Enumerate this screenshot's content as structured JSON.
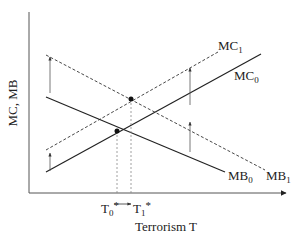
{
  "diagram": {
    "y_axis_label": "MC, MB",
    "x_axis_label": "Terrorism T",
    "curves": [
      {
        "id": "MC0",
        "label": "MC",
        "sub": "0",
        "style": "solid",
        "x1": 46,
        "y1": 172,
        "x2": 261,
        "y2": 54,
        "lx": 234,
        "ly": 80
      },
      {
        "id": "MC1",
        "label": "MC",
        "sub": "1",
        "style": "dashed",
        "x1": 46,
        "y1": 150,
        "x2": 218,
        "y2": 52,
        "lx": 218,
        "ly": 50
      },
      {
        "id": "MB0",
        "label": "MB",
        "sub": "0",
        "style": "solid",
        "x1": 46,
        "y1": 97,
        "x2": 225,
        "y2": 172,
        "lx": 228,
        "ly": 180
      },
      {
        "id": "MB1",
        "label": "MB",
        "sub": "1",
        "style": "dashed",
        "x1": 46,
        "y1": 55,
        "x2": 265,
        "y2": 170,
        "lx": 266,
        "ly": 180
      }
    ],
    "equilibria": [
      {
        "id": "T0",
        "label": "T",
        "sub": "0",
        "star": "*",
        "x": 117,
        "y": 131
      },
      {
        "id": "T1",
        "label": "T",
        "sub": "1",
        "star": "*",
        "x": 131,
        "y": 99
      }
    ],
    "shift_arrows": [
      {
        "x": 50,
        "y_from": 93,
        "y_to": 57
      },
      {
        "x": 50,
        "y_from": 171,
        "y_to": 153
      },
      {
        "x": 190,
        "y_from": 105,
        "y_to": 68
      },
      {
        "x": 190,
        "y_from": 152,
        "y_to": 122
      }
    ],
    "colors": {
      "line": "#222222",
      "dashed": "#333333",
      "guide": "#888888"
    }
  }
}
